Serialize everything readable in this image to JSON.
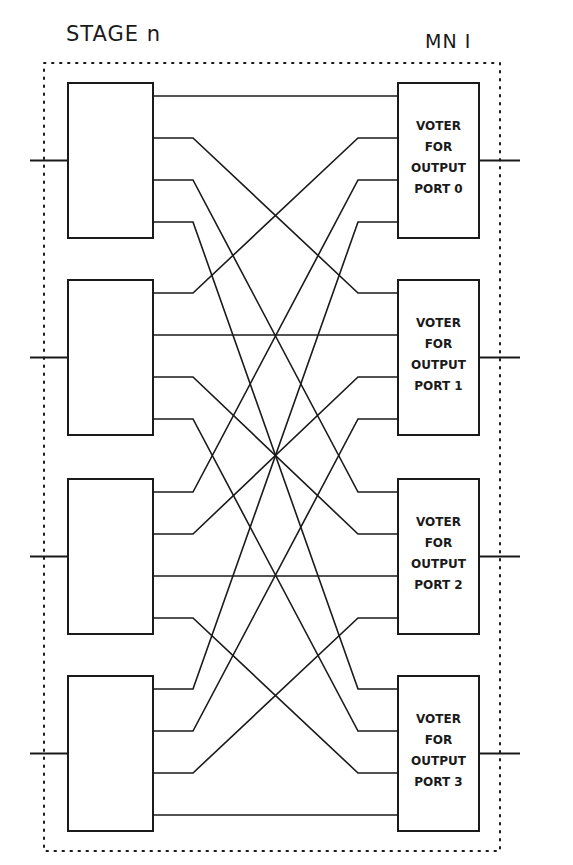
{
  "header": {
    "stage_title": "STAGE n",
    "module_label": "MN I"
  },
  "diagram": {
    "type": "interconnect-network",
    "left_boxes": [
      {
        "id": "switch-0",
        "label": "",
        "outputs": 4
      },
      {
        "id": "switch-1",
        "label": "",
        "outputs": 4
      },
      {
        "id": "switch-2",
        "label": "",
        "outputs": 4
      },
      {
        "id": "switch-3",
        "label": "",
        "outputs": 4
      }
    ],
    "voters": [
      {
        "line1": "VOTER",
        "line2": "FOR",
        "line3": "OUTPUT",
        "line4": "PORT 0"
      },
      {
        "line1": "VOTER",
        "line2": "FOR",
        "line3": "OUTPUT",
        "line4": "PORT 1"
      },
      {
        "line1": "VOTER",
        "line2": "FOR",
        "line3": "OUTPUT",
        "line4": "PORT 2"
      },
      {
        "line1": "VOTER",
        "line2": "FOR",
        "line3": "OUTPUT",
        "line4": "PORT 3"
      }
    ],
    "connection_rule": "output j of switch i -> input i of voter j",
    "colors": {
      "line": "#1a1a1a",
      "background": "#ffffff"
    }
  }
}
